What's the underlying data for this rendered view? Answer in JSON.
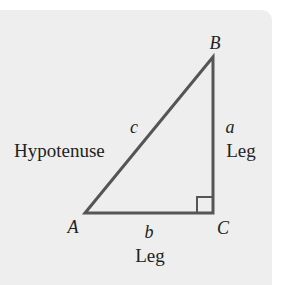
{
  "diagram": {
    "type": "right-triangle",
    "vertices": {
      "A": {
        "label": "A",
        "x": 85,
        "y": 213
      },
      "B": {
        "label": "B",
        "x": 213,
        "y": 57
      },
      "C": {
        "label": "C",
        "x": 213,
        "y": 213
      }
    },
    "sides": {
      "a": {
        "label": "a",
        "role": "Leg"
      },
      "b": {
        "label": "b",
        "role": "Leg"
      },
      "c": {
        "label": "c",
        "role": "Hypotenuse"
      }
    },
    "right_angle_at": "C"
  },
  "labels": {
    "vertex_a": "A",
    "vertex_b": "B",
    "vertex_c": "C",
    "side_a": "a",
    "side_b": "b",
    "side_c": "c",
    "hypotenuse": "Hypotenuse",
    "leg_a": "Leg",
    "leg_b": "Leg"
  },
  "colors": {
    "panel": "#eeeeee",
    "stroke": "#555555",
    "text": "#222222"
  }
}
